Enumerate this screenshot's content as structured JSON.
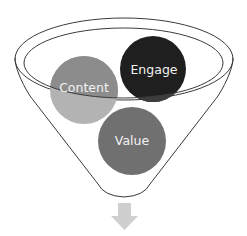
{
  "diagram": {
    "type": "funnel",
    "circles": [
      {
        "label": "Content",
        "color_top": "#8c8c8c",
        "color_bottom": "#b3b3b3"
      },
      {
        "label": "Engage",
        "color": "#1f1f1f"
      },
      {
        "label": "Value",
        "color": "#707070"
      }
    ],
    "funnel_outline_color": "#3a3a3a",
    "arrow": {
      "direction": "down",
      "color": "#cfcfcf"
    }
  }
}
